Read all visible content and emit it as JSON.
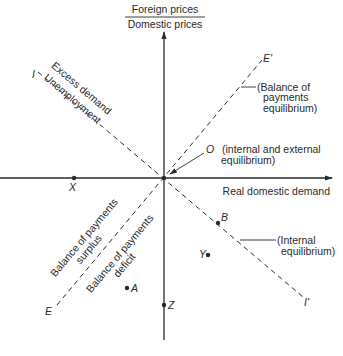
{
  "axes": {
    "y_label_numerator": "Foreign prices",
    "y_label_denominator": "Domestic prices",
    "x_label": "Real domestic demand"
  },
  "lines": {
    "internal": {
      "start_label": "I",
      "end_label": "I'",
      "annotation_line1": "(Internal",
      "annotation_line2": "equilibrium)"
    },
    "external": {
      "start_label": "E",
      "end_label": "E'",
      "annotation_line1": "(Balance of",
      "annotation_line2": "payments",
      "annotation_line3": "equilibrium)"
    }
  },
  "regions": {
    "excess_demand": "Excess demand",
    "unemployment": "Unemployment",
    "bop_surplus_line1": "Balance of payments",
    "bop_surplus_line2": "surplus",
    "bop_deficit_line1": "Balance of payments",
    "bop_deficit_line2": "deficit"
  },
  "origin": {
    "label": "O",
    "annotation_line1": "(internal and external",
    "annotation_line2": "equilibrium)"
  },
  "points": {
    "X": "X",
    "Z": "Z",
    "A": "A",
    "B": "B",
    "Y": "Y"
  },
  "colors": {
    "ink": "#2a2a2a",
    "background": "#ffffff"
  }
}
